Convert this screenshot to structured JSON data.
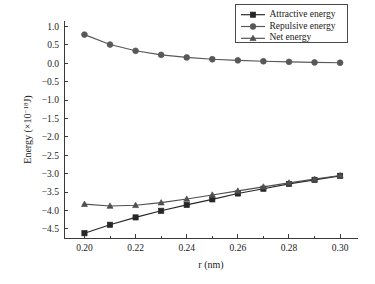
{
  "chart_data": {
    "type": "line",
    "title": "",
    "xlabel": "r (nm)",
    "ylabel_main": "Energy (",
    "ylabel_mult": "×10",
    "ylabel_exp": "−18",
    "ylabel_unit": "J)",
    "ylabel_full": "Energy (×10⁻¹⁸J)",
    "x": [
      0.2,
      0.21,
      0.22,
      0.23,
      0.24,
      0.25,
      0.26,
      0.27,
      0.28,
      0.29,
      0.3
    ],
    "xlim": [
      0.192,
      0.307
    ],
    "ylim": [
      -4.75,
      1.15
    ],
    "xticks": [
      0.2,
      0.22,
      0.24,
      0.26,
      0.28,
      0.3
    ],
    "xtick_labels": [
      "0.20",
      "0.22",
      "0.24",
      "0.26",
      "0.28",
      "0.30"
    ],
    "xticks_minor": [
      0.21,
      0.23,
      0.25,
      0.27,
      0.29
    ],
    "yticks": [
      1.0,
      0.5,
      0.0,
      -0.5,
      -1.0,
      -1.5,
      -2.0,
      -2.5,
      -3.0,
      -3.5,
      -4.0,
      -4.5
    ],
    "ytick_labels": [
      "1.0",
      "0.5",
      "0.0",
      "−0.5",
      "−1.0",
      "−1.5",
      "−2.0",
      "−2.5",
      "−3.0",
      "−3.5",
      "−4.0",
      "−4.5"
    ],
    "grid": false,
    "legend_position": "top-right",
    "series": [
      {
        "name": "Attractive energy",
        "marker": "square",
        "color": "#262626",
        "values": [
          -4.62,
          -4.39,
          -4.19,
          -4.01,
          -3.85,
          -3.7,
          -3.54,
          -3.41,
          -3.28,
          -3.17,
          -3.06
        ]
      },
      {
        "name": "Repulsive energy",
        "marker": "circle",
        "color": "#585858",
        "values": [
          0.78,
          0.51,
          0.34,
          0.23,
          0.16,
          0.11,
          0.08,
          0.055,
          0.04,
          0.025,
          0.015
        ]
      },
      {
        "name": "Net energy",
        "marker": "triangle",
        "color": "#4f4f4f",
        "values": [
          -3.83,
          -3.88,
          -3.86,
          -3.79,
          -3.69,
          -3.58,
          -3.47,
          -3.36,
          -3.25,
          -3.15,
          -3.05
        ]
      }
    ]
  },
  "legend": {
    "entries": [
      {
        "label": "Attractive energy"
      },
      {
        "label": "Repulsive energy"
      },
      {
        "label": "Net energy"
      }
    ]
  }
}
